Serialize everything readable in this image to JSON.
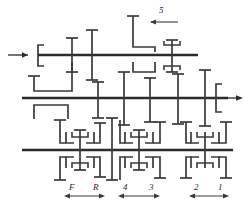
{
  "diagram": {
    "type": "kinematic-schematic",
    "colors": {
      "background": "#ffffff",
      "shaft": "#2b2b2b",
      "gear": "#3a3a3a",
      "label": "#2b2b2b"
    },
    "shafts": [
      {
        "name": "input-shaft",
        "y": 55,
        "x1": 38,
        "x2": 198
      },
      {
        "name": "output-shaft",
        "y": 98,
        "x1": 22,
        "x2": 228
      },
      {
        "name": "countershaft",
        "y": 150,
        "x1": 22,
        "x2": 233
      }
    ],
    "flow": {
      "input_arrow": {
        "name": "input-arrow",
        "x": 8,
        "y": 55,
        "direction": "right"
      },
      "output_arrow": {
        "name": "output-arrow",
        "x": 232,
        "y": 98,
        "direction": "right"
      }
    },
    "labels": {
      "gear_5": "5",
      "gear_F": "F",
      "gear_R": "R",
      "gear_4": "4",
      "gear_3": "3",
      "gear_2": "2",
      "gear_1": "1"
    },
    "label_positions": [
      {
        "key": "gear_5",
        "text": "5",
        "x": 161,
        "y": 9,
        "name": "label-5"
      },
      {
        "key": "gear_F",
        "text": "F",
        "x": 70,
        "y": 184,
        "name": "label-f"
      },
      {
        "key": "gear_R",
        "text": "R",
        "x": 94,
        "y": 184,
        "name": "label-r"
      },
      {
        "key": "gear_4",
        "text": "4",
        "x": 124,
        "y": 184,
        "name": "label-4"
      },
      {
        "key": "gear_3",
        "text": "3",
        "x": 150,
        "y": 184,
        "name": "label-3"
      },
      {
        "key": "gear_2",
        "text": "2",
        "x": 195,
        "y": 184,
        "name": "label-2"
      },
      {
        "key": "gear_1",
        "text": "1",
        "x": 219,
        "y": 184,
        "name": "label-1"
      }
    ],
    "dimension_arrows": [
      {
        "name": "shift-range-fr",
        "x1": 66,
        "x2": 103,
        "y": 196
      },
      {
        "name": "shift-range-43",
        "x1": 120,
        "x2": 158,
        "y": 196
      },
      {
        "name": "shift-range-21",
        "x1": 191,
        "x2": 227,
        "y": 196
      }
    ],
    "synchronizers": [
      {
        "name": "synchronizer-5th",
        "shaft": "input-shaft",
        "x": 172
      },
      {
        "name": "synchronizer-fr",
        "shaft": "countershaft",
        "x": 80
      },
      {
        "name": "synchronizer-34",
        "shaft": "countershaft",
        "x": 139
      },
      {
        "name": "synchronizer-12",
        "shaft": "countershaft",
        "x": 205
      }
    ]
  }
}
